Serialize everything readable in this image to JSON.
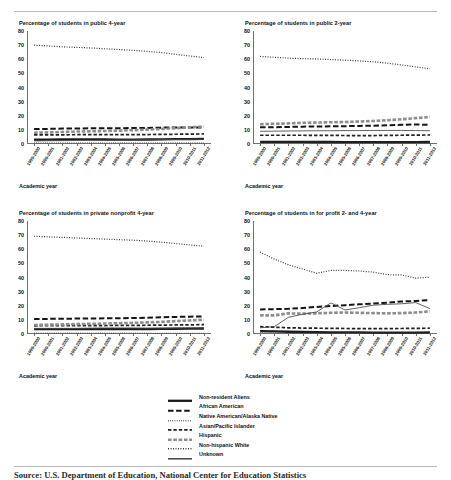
{
  "figure": {
    "xaxis_label": "Academic year",
    "caption": "Source: U.S. Department of Education, National Center for Education Statistics",
    "ylim": [
      0,
      80
    ],
    "yticks": [
      0,
      10,
      20,
      30,
      40,
      50,
      60,
      70,
      80
    ],
    "categories": [
      "1999-2000",
      "2000-2001",
      "2001-2002",
      "2002-2003",
      "2003-2004",
      "2004-2005",
      "2005-2006",
      "2006-2007",
      "2007-2008",
      "2008-2009",
      "2009-2010",
      "2010-2011",
      "2011-2012"
    ],
    "legend": [
      {
        "label": "Non-resident Aliens",
        "style": "solid-thick",
        "color": "#1a1a1a"
      },
      {
        "label": "African American",
        "style": "long-dash",
        "color": "#1a1a1a"
      },
      {
        "label": "Native American/Alaska Native",
        "style": "fine-dots",
        "color": "#3a3a3a"
      },
      {
        "label": "Asian/Pacific Islander",
        "style": "medium-dash",
        "color": "#1a1a1a"
      },
      {
        "label": "Hispanic",
        "style": "thick-dash",
        "color": "#8d8d8d"
      },
      {
        "label": "Non-hispanic White",
        "style": "small-dots",
        "color": "#3a3a3a"
      },
      {
        "label": "Unknown",
        "style": "solid-thin",
        "color": "#555555"
      }
    ]
  },
  "chart_data": [
    {
      "type": "line",
      "title": "Percentage of students in public 4-year",
      "xlabel": "Academic year",
      "ylabel": "",
      "ylim": [
        0,
        80
      ],
      "grid": false,
      "legend_position": "below-figure-shared",
      "x": [
        "1999-2000",
        "2000-2001",
        "2001-2002",
        "2002-2003",
        "2003-2004",
        "2004-2005",
        "2005-2006",
        "2006-2007",
        "2007-2008",
        "2008-2009",
        "2009-2010",
        "2010-2011",
        "2011-2012"
      ],
      "series": [
        {
          "name": "Non-resident Aliens",
          "values": [
            3.0,
            3.1,
            3.2,
            3.3,
            3.3,
            3.2,
            3.1,
            3.1,
            3.2,
            3.3,
            3.4,
            3.5,
            3.6
          ]
        },
        {
          "name": "African American",
          "values": [
            10.6,
            10.7,
            10.9,
            11.0,
            11.1,
            11.2,
            11.2,
            11.3,
            11.4,
            11.6,
            11.7,
            11.7,
            11.6
          ]
        },
        {
          "name": "Native American/Alaska Native",
          "values": [
            0.9,
            0.9,
            0.9,
            0.9,
            0.9,
            0.9,
            0.9,
            0.9,
            0.9,
            0.8,
            0.8,
            0.8,
            0.8
          ]
        },
        {
          "name": "Asian/Pacific Islander",
          "values": [
            6.4,
            6.5,
            6.5,
            6.6,
            6.6,
            6.6,
            6.6,
            6.7,
            6.7,
            6.8,
            6.9,
            7.0,
            7.1
          ]
        },
        {
          "name": "Hispanic",
          "values": [
            8.0,
            8.2,
            8.5,
            8.8,
            9.0,
            9.2,
            9.5,
            9.8,
            10.2,
            10.6,
            11.2,
            11.8,
            12.3
          ]
        },
        {
          "name": "Non-hispanic White",
          "values": [
            70.0,
            69.4,
            68.8,
            68.4,
            68.0,
            67.4,
            66.9,
            66.3,
            65.6,
            64.7,
            63.5,
            62.3,
            61.2
          ]
        },
        {
          "name": "Unknown",
          "values": [
            2.2,
            2.3,
            2.4,
            2.5,
            2.6,
            2.7,
            2.8,
            2.9,
            3.0,
            3.1,
            3.2,
            3.3,
            3.4
          ]
        }
      ]
    },
    {
      "type": "line",
      "title": "Percentage of students in public 2-year",
      "xlabel": "Academic year",
      "ylabel": "",
      "ylim": [
        0,
        80
      ],
      "grid": false,
      "legend_position": "below-figure-shared",
      "x": [
        "1999-2000",
        "2000-2001",
        "2001-2002",
        "2002-2003",
        "2003-2004",
        "2004-2005",
        "2005-2006",
        "2006-2007",
        "2007-2008",
        "2008-2009",
        "2009-2010",
        "2010-2011",
        "2011-2012"
      ],
      "series": [
        {
          "name": "Non-resident Aliens",
          "values": [
            1.5,
            1.5,
            1.5,
            1.5,
            1.4,
            1.4,
            1.3,
            1.3,
            1.3,
            1.3,
            1.3,
            1.3,
            1.4
          ]
        },
        {
          "name": "African American",
          "values": [
            11.8,
            11.9,
            12.1,
            12.3,
            12.4,
            12.5,
            12.6,
            12.8,
            13.0,
            13.3,
            13.6,
            13.8,
            13.6
          ]
        },
        {
          "name": "Native American/Alaska Native",
          "values": [
            1.3,
            1.3,
            1.3,
            1.3,
            1.3,
            1.2,
            1.2,
            1.2,
            1.2,
            1.1,
            1.1,
            1.1,
            1.0
          ]
        },
        {
          "name": "Asian/Pacific Islander",
          "values": [
            6.2,
            6.2,
            6.2,
            6.2,
            6.1,
            6.1,
            6.0,
            6.0,
            6.0,
            6.1,
            6.2,
            6.3,
            6.4
          ]
        },
        {
          "name": "Hispanic",
          "values": [
            14.0,
            14.3,
            14.6,
            15.0,
            15.2,
            15.4,
            15.6,
            15.9,
            16.3,
            16.8,
            17.5,
            18.3,
            19.1
          ]
        },
        {
          "name": "Non-hispanic White",
          "values": [
            62.0,
            61.4,
            60.8,
            60.4,
            60.2,
            59.8,
            59.4,
            58.8,
            58.2,
            57.2,
            56.0,
            54.6,
            53.2
          ]
        },
        {
          "name": "Unknown",
          "values": [
            9.0,
            9.1,
            9.2,
            9.3,
            9.4,
            9.4,
            9.5,
            9.5,
            9.6,
            9.6,
            9.6,
            9.5,
            9.4
          ]
        }
      ]
    },
    {
      "type": "line",
      "title": "Percentage of students in private nonprofit 4-year",
      "xlabel": "Academic year",
      "ylabel": "",
      "ylim": [
        0,
        80
      ],
      "grid": false,
      "legend_position": "below-figure-shared",
      "x": [
        "1999-2000",
        "2000-2001",
        "2001-2002",
        "2002-2003",
        "2003-2004",
        "2004-2005",
        "2005-2006",
        "2006-2007",
        "2007-2008",
        "2008-2009",
        "2009-2010",
        "2010-2011",
        "2011-2012"
      ],
      "series": [
        {
          "name": "Non-resident Aliens",
          "values": [
            3.4,
            3.4,
            3.5,
            3.5,
            3.4,
            3.4,
            3.4,
            3.4,
            3.5,
            3.6,
            3.7,
            3.8,
            3.9
          ]
        },
        {
          "name": "African American",
          "values": [
            10.6,
            10.7,
            10.8,
            10.9,
            11.0,
            11.1,
            11.2,
            11.3,
            11.5,
            11.8,
            12.1,
            12.3,
            12.4
          ]
        },
        {
          "name": "Native American/Alaska Native",
          "values": [
            0.6,
            0.6,
            0.6,
            0.6,
            0.6,
            0.6,
            0.6,
            0.6,
            0.6,
            0.5,
            0.5,
            0.5,
            0.5
          ]
        },
        {
          "name": "Asian/Pacific Islander",
          "values": [
            5.8,
            5.9,
            5.9,
            6.0,
            6.0,
            6.0,
            6.1,
            6.1,
            6.2,
            6.3,
            6.4,
            6.5,
            6.6
          ]
        },
        {
          "name": "Hispanic",
          "values": [
            6.4,
            6.6,
            6.8,
            7.0,
            7.2,
            7.4,
            7.6,
            7.9,
            8.2,
            8.6,
            9.1,
            9.6,
            10.1
          ]
        },
        {
          "name": "Non-hispanic White",
          "values": [
            69.2,
            68.8,
            68.4,
            68.0,
            67.6,
            67.2,
            66.8,
            66.4,
            65.8,
            65.0,
            64.0,
            63.0,
            62.2
          ]
        },
        {
          "name": "Unknown",
          "values": [
            4.0,
            4.0,
            4.0,
            4.0,
            4.2,
            4.3,
            4.3,
            4.3,
            4.2,
            4.2,
            4.2,
            4.3,
            4.3
          ]
        }
      ]
    },
    {
      "type": "line",
      "title": "Percentage of students in for profit 2- and 4-year",
      "xlabel": "Academic year",
      "ylabel": "",
      "ylim": [
        0,
        80
      ],
      "grid": false,
      "legend_position": "below-figure-shared",
      "x": [
        "1999-2000",
        "2000-2001",
        "2001-2002",
        "2002-2003",
        "2003-2004",
        "2004-2005",
        "2005-2006",
        "2006-2007",
        "2007-2008",
        "2008-2009",
        "2009-2010",
        "2010-2011",
        "2011-2012"
      ],
      "series": [
        {
          "name": "Non-resident Aliens",
          "values": [
            2.0,
            1.8,
            1.6,
            1.4,
            1.3,
            1.2,
            1.1,
            1.1,
            1.0,
            1.0,
            1.0,
            1.0,
            1.1
          ]
        },
        {
          "name": "African American",
          "values": [
            17.4,
            17.6,
            17.8,
            18.4,
            19.2,
            19.8,
            20.4,
            21.0,
            21.6,
            22.2,
            23.0,
            23.4,
            24.0
          ]
        },
        {
          "name": "Native American/Alaska Native",
          "values": [
            1.2,
            1.2,
            1.2,
            1.2,
            1.2,
            1.2,
            1.1,
            1.1,
            1.1,
            1.0,
            1.0,
            1.0,
            1.0
          ]
        },
        {
          "name": "Asian/Pacific Islander",
          "values": [
            5.2,
            4.8,
            4.4,
            4.2,
            4.1,
            4.0,
            3.9,
            3.8,
            3.8,
            3.8,
            3.9,
            4.0,
            4.1
          ]
        },
        {
          "name": "Hispanic",
          "values": [
            13.2,
            13.2,
            14.6,
            14.4,
            14.6,
            15.0,
            15.2,
            15.0,
            14.8,
            14.6,
            14.8,
            15.2,
            16.0
          ]
        },
        {
          "name": "Non-hispanic White",
          "values": [
            58.0,
            53.0,
            49.0,
            46.0,
            43.0,
            45.0,
            45.0,
            44.6,
            43.8,
            42.0,
            41.8,
            39.6,
            40.2
          ]
        },
        {
          "name": "Unknown",
          "values": [
            4.4,
            5.2,
            11.8,
            14.0,
            15.6,
            22.0,
            17.0,
            18.6,
            20.4,
            21.0,
            21.4,
            22.2,
            18.0
          ]
        }
      ]
    }
  ]
}
